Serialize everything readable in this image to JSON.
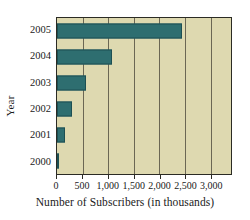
{
  "chart_data": {
    "type": "bar",
    "orientation": "horizontal",
    "title": "",
    "xlabel": "Number of Subscribers (in thousands)",
    "ylabel": "Year",
    "categories": [
      "2005",
      "2004",
      "2003",
      "2002",
      "2001",
      "2000"
    ],
    "values": [
      2450,
      1080,
      560,
      300,
      150,
      30
    ],
    "xlim": [
      0,
      3400
    ],
    "ylim": null,
    "xticks": [
      0,
      500,
      1000,
      1500,
      2000,
      2500,
      3000
    ],
    "xticklabels": [
      "0",
      "500",
      "1,000",
      "1,500",
      "2,000",
      "2,500",
      "3,000"
    ],
    "grid": "vertical",
    "legend": null,
    "bar_color": "#2e6e70",
    "plot_background": "#ded9b0",
    "gridline_color": "#6b6754",
    "axis_color": "#2b2b24"
  }
}
